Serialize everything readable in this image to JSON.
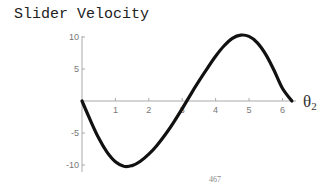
{
  "chart_data": {
    "type": "line",
    "title": "Slider Velocity",
    "xlabel": "θ2",
    "ylabel": "",
    "xlim": [
      0,
      6.283
    ],
    "ylim": [
      -10,
      10
    ],
    "x_ticks": [
      1,
      2,
      3,
      4,
      5,
      6
    ],
    "y_ticks": [
      10,
      5,
      -5,
      -10
    ],
    "grid": false,
    "legend": null,
    "series": [
      {
        "name": "Slider Velocity",
        "x": [
          0,
          0.25,
          0.5,
          0.75,
          1.0,
          1.25,
          1.5,
          1.75,
          2.0,
          2.25,
          2.5,
          2.75,
          3.0,
          3.25,
          3.5,
          3.75,
          4.0,
          4.25,
          4.5,
          4.75,
          5.0,
          5.25,
          5.5,
          5.75,
          6.0,
          6.283
        ],
        "values": [
          0,
          -3.0,
          -5.8,
          -8.0,
          -9.5,
          -10.2,
          -10.1,
          -9.4,
          -8.3,
          -6.9,
          -5.2,
          -3.3,
          -1.2,
          1.0,
          3.1,
          5.1,
          7.0,
          8.6,
          9.8,
          10.3,
          10.1,
          9.1,
          7.3,
          4.8,
          2.0,
          0
        ]
      }
    ],
    "annotations": [
      "467"
    ]
  },
  "title": "Slider Velocity",
  "axes": {
    "x_label_main": "θ",
    "x_label_sub": "2",
    "x_ticks": [
      "1",
      "2",
      "3",
      "4",
      "5",
      "6"
    ],
    "y_ticks": [
      "10",
      "5",
      "-5",
      "-10"
    ]
  },
  "page_number": "467"
}
